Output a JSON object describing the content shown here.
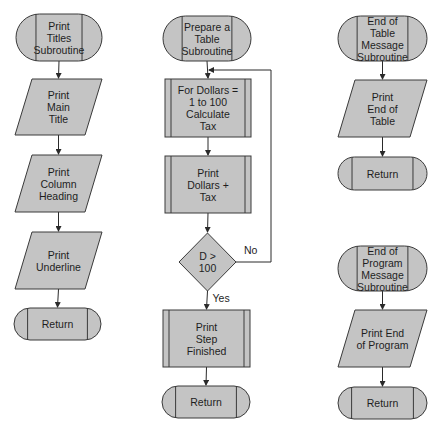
{
  "diagram": {
    "type": "flowchart",
    "colors": {
      "fill": "#c4c4c4",
      "stroke": "#3a3a3a",
      "background": "#ffffff"
    },
    "columns": [
      {
        "name": "print-titles",
        "nodes": [
          {
            "id": "t1",
            "kind": "terminal",
            "label": "Print\nTitles\nSubroutine",
            "x": 16,
            "y": 14,
            "w": 86,
            "h": 47
          },
          {
            "id": "t2",
            "kind": "io",
            "label": "Print\nMain\nTitle",
            "x": 15,
            "y": 79,
            "w": 87,
            "h": 56
          },
          {
            "id": "t3",
            "kind": "io",
            "label": "Print\nColumn\nHeading",
            "x": 15,
            "y": 155,
            "w": 87,
            "h": 57
          },
          {
            "id": "t4",
            "kind": "io",
            "label": "Print\nUnderline",
            "x": 15,
            "y": 232,
            "w": 87,
            "h": 57
          },
          {
            "id": "t5",
            "kind": "terminal",
            "label": "Return",
            "x": 14,
            "y": 308,
            "w": 87,
            "h": 32
          }
        ]
      },
      {
        "name": "prepare-table",
        "nodes": [
          {
            "id": "m1",
            "kind": "terminal",
            "label": "Prepare a\nTable\nSubroutine",
            "x": 163,
            "y": 16,
            "w": 88,
            "h": 45
          },
          {
            "id": "m2",
            "kind": "process",
            "label": "For Dollars =\n1 to 100\nCalculate\nTax",
            "x": 165,
            "y": 79,
            "w": 86,
            "h": 58
          },
          {
            "id": "m3",
            "kind": "process",
            "label": "Print\nDollars +\nTax",
            "x": 165,
            "y": 156,
            "w": 86,
            "h": 57
          },
          {
            "id": "m4",
            "kind": "decision",
            "label": "D >\n100",
            "x": 179,
            "y": 233,
            "w": 57,
            "h": 58
          },
          {
            "id": "m5",
            "kind": "process",
            "label": "Print\nStep\nFinished",
            "x": 163,
            "y": 310,
            "w": 87,
            "h": 57
          },
          {
            "id": "m6",
            "kind": "terminal",
            "label": "Return",
            "x": 162,
            "y": 386,
            "w": 88,
            "h": 32
          }
        ],
        "edge_labels": {
          "no": "No",
          "yes": "Yes"
        }
      },
      {
        "name": "end-messages",
        "nodes": [
          {
            "id": "r1",
            "kind": "terminal",
            "label": "End of\nTable\nMessage\nSubroutine",
            "x": 338,
            "y": 16,
            "w": 89,
            "h": 45
          },
          {
            "id": "r2",
            "kind": "io",
            "label": "Print\nEnd of\nTable",
            "x": 338,
            "y": 80,
            "w": 89,
            "h": 57
          },
          {
            "id": "r3",
            "kind": "terminal",
            "label": "Return",
            "x": 338,
            "y": 157,
            "w": 89,
            "h": 33
          },
          {
            "id": "r4",
            "kind": "terminal",
            "label": "End of\nProgram\nMessage\nSubroutine",
            "x": 338,
            "y": 246,
            "w": 89,
            "h": 45
          },
          {
            "id": "r5",
            "kind": "io",
            "label": "Print End\nof Program",
            "x": 338,
            "y": 310,
            "w": 89,
            "h": 57
          },
          {
            "id": "r6",
            "kind": "terminal",
            "label": "Return",
            "x": 338,
            "y": 387,
            "w": 89,
            "h": 32
          }
        ]
      }
    ],
    "edges": [
      [
        "t1",
        "t2"
      ],
      [
        "t2",
        "t3"
      ],
      [
        "t3",
        "t4"
      ],
      [
        "t4",
        "t5"
      ],
      [
        "m1",
        "m2"
      ],
      [
        "m2",
        "m3"
      ],
      [
        "m3",
        "m4"
      ],
      [
        "m4",
        "m5",
        "yes"
      ],
      [
        "m5",
        "m6"
      ],
      [
        "m4",
        "m2",
        "no"
      ],
      [
        "r1",
        "r2"
      ],
      [
        "r2",
        "r3"
      ],
      [
        "r4",
        "r5"
      ],
      [
        "r5",
        "r6"
      ]
    ]
  }
}
